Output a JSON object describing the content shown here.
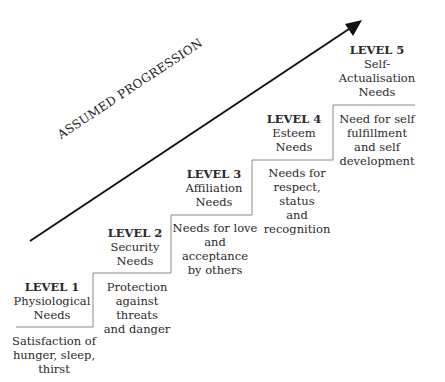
{
  "diagram": {
    "arrow_label": "ASSUMED PROGRESSION",
    "levels": [
      {
        "level": "LEVEL 1",
        "name_lines": [
          "Physiological",
          "Needs"
        ],
        "desc_lines": [
          "Satisfaction of",
          "hunger, sleep,",
          "thirst"
        ]
      },
      {
        "level": "LEVEL 2",
        "name_lines": [
          "Security",
          "Needs"
        ],
        "desc_lines": [
          "Protection",
          "against threats",
          "and danger"
        ]
      },
      {
        "level": "LEVEL 3",
        "name_lines": [
          "Affiliation",
          "Needs"
        ],
        "desc_lines": [
          "Needs for love",
          "and acceptance",
          "by others"
        ]
      },
      {
        "level": "LEVEL 4",
        "name_lines": [
          "Esteem",
          "Needs"
        ],
        "desc_lines": [
          "Needs for",
          "respect, status",
          "and recognition"
        ]
      },
      {
        "level": "LEVEL 5",
        "name_lines": [
          "Self-",
          "Actualisation",
          "Needs"
        ],
        "desc_lines": [
          "Need for self",
          "fulfillment",
          "and self",
          "development"
        ]
      }
    ]
  }
}
